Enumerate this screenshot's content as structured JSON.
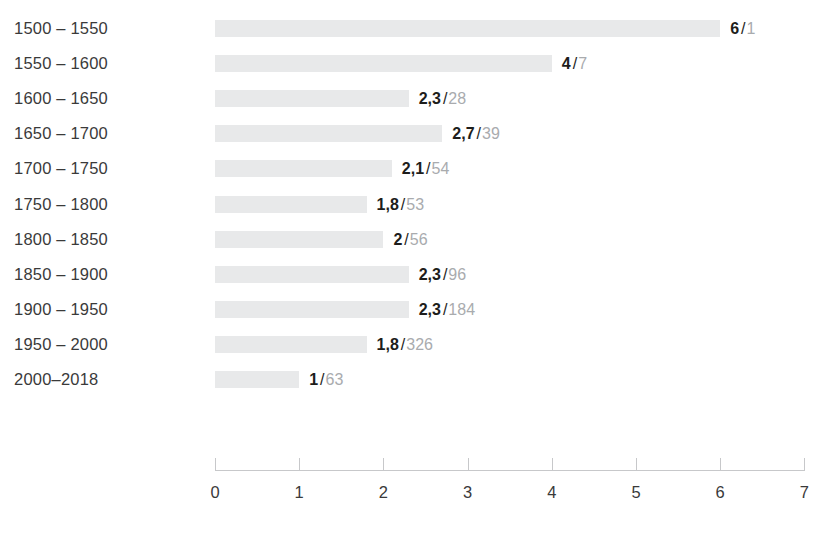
{
  "chart_data": {
    "type": "bar",
    "orientation": "horizontal",
    "title": "",
    "xlabel": "",
    "ylabel": "",
    "xlim": [
      0,
      7
    ],
    "grid": false,
    "legend": null,
    "xticks": [
      "0",
      "1",
      "2",
      "3",
      "4",
      "5",
      "6",
      "7"
    ],
    "xtick_values": [
      0,
      1,
      2,
      3,
      4,
      5,
      6,
      7
    ],
    "categories": [
      "1500 – 1550",
      "1550 – 1600",
      "1600 – 1650",
      "1650 – 1700",
      "1700 – 1750",
      "1750 – 1800",
      "1800 – 1850",
      "1850 – 1900",
      "1900 – 1950",
      "1950 – 2000",
      "2000–2018"
    ],
    "values": [
      6,
      4,
      2.3,
      2.7,
      2.1,
      1.8,
      2,
      2.3,
      2.3,
      1.8,
      1
    ],
    "value_labels": [
      "6",
      "4",
      "2,3",
      "2,7",
      "2,1",
      "1,8",
      "2",
      "2,3",
      "2,3",
      "1,8",
      "1"
    ],
    "secondary_labels": [
      "1",
      "7",
      "28",
      "39",
      "54",
      "53",
      "56",
      "96",
      "184",
      "326",
      "63"
    ],
    "secondary_values": [
      1,
      7,
      28,
      39,
      54,
      53,
      56,
      96,
      184,
      326,
      63
    ],
    "label_separator": "/",
    "bar_color": "#e8e9ea",
    "primary_text_color": "#1d1d1b",
    "secondary_text_color": "#a9abae",
    "axis_color": "#c7c8ca"
  },
  "footer": {
    "caption": ""
  }
}
